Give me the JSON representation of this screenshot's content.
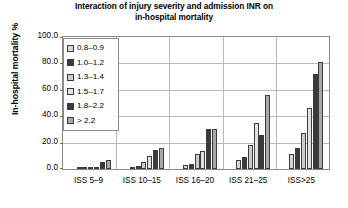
{
  "chart_data": {
    "type": "bar",
    "title": "Interaction of injury severity and admission INR on in-hospital mortality",
    "title_lines": [
      "Interaction of injury severity and admission INR on",
      "in-hospital mortality"
    ],
    "xlabel": "",
    "ylabel": "In-hospital mortality %",
    "ylim": [
      0.0,
      100.0
    ],
    "yticks": [
      "0.0",
      "20.0",
      "40.0",
      "60.0",
      "80.0",
      "100.0"
    ],
    "ytick_values": [
      0.0,
      20.0,
      40.0,
      60.0,
      80.0,
      100.0
    ],
    "grid": true,
    "legend_position": "top-left inside plot",
    "categories": [
      "ISS 5–9",
      "ISS 10–15",
      "ISS 16–20",
      "ISS 21–25",
      "ISS>25"
    ],
    "series": [
      {
        "name": "0.8–0.9",
        "color": "#d5d5d5",
        "values": [
          0.5,
          1.5,
          3.0,
          7.0,
          11.0
        ]
      },
      {
        "name": "1.0–1.2",
        "color": "#3a3a3a",
        "values": [
          0.5,
          2.0,
          4.0,
          9.0,
          16.0
        ]
      },
      {
        "name": "1.3–1.4",
        "color": "#cccccc",
        "values": [
          1.0,
          5.0,
          11.5,
          18.0,
          27.0
        ]
      },
      {
        "name": "1.5–1.7",
        "color": "#e2e2e2",
        "values": [
          1.5,
          9.5,
          14.0,
          35.0,
          46.0
        ]
      },
      {
        "name": "1.8–2.2",
        "color": "#3a3a3a",
        "values": [
          5.5,
          14.5,
          30.0,
          26.0,
          72.0
        ]
      },
      {
        "name": "> 2.2",
        "color": "#a8a8a8",
        "values": [
          7.0,
          16.0,
          30.5,
          56.0,
          81.0
        ]
      }
    ]
  },
  "legend": {
    "items": [
      {
        "label": "0.8–0.9",
        "color": "#d5d5d5"
      },
      {
        "label": "1.0–1.2",
        "color": "#3a3a3a"
      },
      {
        "label": "1.3–1.4",
        "color": "#cccccc"
      },
      {
        "label": "1.5–1.7",
        "color": "#e2e2e2"
      },
      {
        "label": "1.8–2.2",
        "color": "#3a3a3a"
      },
      {
        "label": "> 2.2",
        "color": "#a8a8a8"
      }
    ]
  }
}
